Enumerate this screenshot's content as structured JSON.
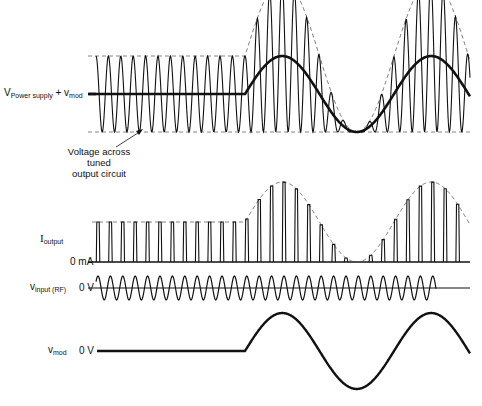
{
  "figure": {
    "colors": {
      "ink": "#111111",
      "envelope": "#555555",
      "background": "#ffffff"
    }
  },
  "labels": {
    "supply_main": "V",
    "supply_sub": "Power supply",
    "plus": "+ v",
    "mod_sub": "mod",
    "voltage_note_line1": "Voltage across",
    "voltage_note_line2": "tuned",
    "voltage_note_line3": "output circuit",
    "i_main": "I",
    "i_sub": "output",
    "zero_ma": "0 mA",
    "vin_main": "v",
    "vin_sub": "input (RF)",
    "zero_v_rf": "0 V",
    "vmod_main": "v",
    "vmod_sub": "mod",
    "zero_v_mod": "0 V"
  },
  "geometry": {
    "x_start": 96,
    "x_mod_start": 245,
    "x_end": 470,
    "rf_period": 12.4,
    "mod_period": 149,
    "tank": {
      "center_y": 94,
      "unmod_amp": 38,
      "mod_amp_frac": 1.0
    },
    "pulses": {
      "base_y": 262,
      "unmod_h": 40,
      "width": 3.5
    },
    "rf_input": {
      "center_y": 288,
      "amp": 12,
      "x_end_wave": 436
    },
    "vmod": {
      "base_y": 351,
      "amp": 38
    }
  }
}
